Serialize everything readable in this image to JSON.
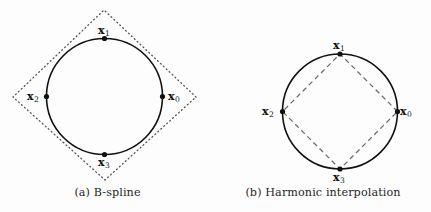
{
  "figure": {
    "background_color": "#fdfdfd",
    "ink_color": "#111111",
    "panels": [
      {
        "id": "a",
        "caption": "(a) B-spline",
        "guide_style": "dotted",
        "guide_shape": "circumscribed-square",
        "circle": {
          "cx": 104.5,
          "cy": 96.5,
          "r": 58
        },
        "guide_vertices": [
          {
            "x": 196,
            "y": 97
          },
          {
            "x": 104,
            "y": 10
          },
          {
            "x": 13,
            "y": 97
          },
          {
            "x": 105,
            "y": 180
          }
        ],
        "points": [
          {
            "name": "x0",
            "var": "x",
            "sub": "0",
            "x": 162.5,
            "y": 96.5,
            "label_x": 168,
            "label_y": 91
          },
          {
            "name": "x1",
            "var": "x",
            "sub": "1",
            "x": 104.5,
            "y": 38.5,
            "label_x": 98,
            "label_y": 25
          },
          {
            "name": "x2",
            "var": "x",
            "sub": "2",
            "x": 46.5,
            "y": 96.5,
            "label_x": 27,
            "label_y": 91
          },
          {
            "name": "x3",
            "var": "x",
            "sub": "3",
            "x": 104.5,
            "y": 154.5,
            "label_x": 98,
            "label_y": 157
          }
        ]
      },
      {
        "id": "b",
        "caption": "(b) Harmonic interpolation",
        "guide_style": "dashed",
        "guide_shape": "inscribed-diamond",
        "circle": {
          "cx": 340,
          "cy": 111.5,
          "r": 57.5
        },
        "guide_vertices": [
          {
            "x": 397.5,
            "y": 111.5
          },
          {
            "x": 340,
            "y": 54
          },
          {
            "x": 282.5,
            "y": 111.5
          },
          {
            "x": 340,
            "y": 169
          }
        ],
        "points": [
          {
            "name": "x0",
            "var": "x",
            "sub": "0",
            "x": 397.5,
            "y": 111.5,
            "label_x": 400,
            "label_y": 106
          },
          {
            "name": "x1",
            "var": "x",
            "sub": "1",
            "x": 340,
            "y": 54,
            "label_x": 333,
            "label_y": 40
          },
          {
            "name": "x2",
            "var": "x",
            "sub": "2",
            "x": 282.5,
            "y": 111.5,
            "label_x": 262,
            "label_y": 106
          },
          {
            "name": "x3",
            "var": "x",
            "sub": "3",
            "x": 340,
            "y": 169,
            "label_x": 333,
            "label_y": 172
          }
        ]
      }
    ]
  }
}
